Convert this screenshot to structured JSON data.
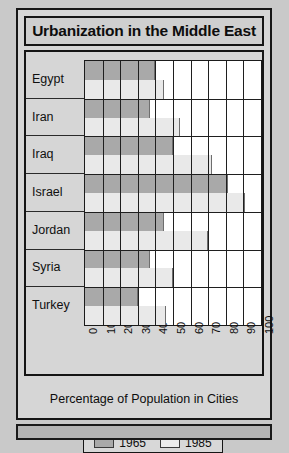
{
  "figure": {
    "title": "Urbanization in the Middle East"
  },
  "axis": {
    "x_title": "Percentage of Population in Cities",
    "tick_labels": [
      "0",
      "10",
      "20",
      "30",
      "40",
      "50",
      "60",
      "70",
      "80",
      "90",
      "100"
    ]
  },
  "legend": {
    "entries": [
      {
        "label": "1965",
        "color": "#a9a9a9"
      },
      {
        "label": "1985",
        "color": "#ececec"
      }
    ]
  },
  "categories": [
    "Egypt",
    "Iran",
    "Iraq",
    "Israel",
    "Jordan",
    "Syria",
    "Turkey"
  ],
  "chart_data": {
    "type": "bar",
    "orientation": "horizontal",
    "title": "Urbanization in the Middle East",
    "xlabel": "Percentage of Population in Cities",
    "ylabel": "",
    "xlim": [
      0,
      100
    ],
    "grid": true,
    "legend_position": "bottom",
    "categories": [
      "Egypt",
      "Iran",
      "Iraq",
      "Israel",
      "Jordan",
      "Syria",
      "Turkey"
    ],
    "series": [
      {
        "name": "1965",
        "color": "#a9a9a9",
        "values": [
          40,
          37,
          50,
          81,
          45,
          37,
          30
        ]
      },
      {
        "name": "1985",
        "color": "#ececec",
        "values": [
          45,
          54,
          72,
          91,
          70,
          50,
          46
        ]
      }
    ]
  }
}
